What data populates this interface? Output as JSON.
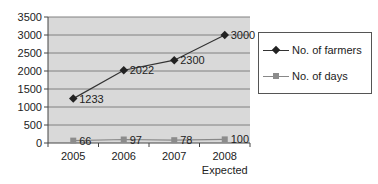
{
  "chart_data": {
    "type": "line",
    "title": "",
    "xlabel": "",
    "ylabel": "",
    "categories": [
      "2005",
      "2006",
      "2007",
      "2008"
    ],
    "category_sublabels": [
      "",
      "",
      "",
      "Expected"
    ],
    "ylim": [
      0,
      3500
    ],
    "yticks": [
      0,
      500,
      1000,
      1500,
      2000,
      2500,
      3000,
      3500
    ],
    "grid": true,
    "legend_position": "right",
    "series": [
      {
        "name": "No. of farmers",
        "values": [
          1233,
          2022,
          2300,
          3000
        ],
        "color": "#333333",
        "marker": "diamond"
      },
      {
        "name": "No. of days",
        "values": [
          66,
          97,
          78,
          100
        ],
        "color": "#888888",
        "marker": "square"
      }
    ]
  },
  "legend": {
    "items": [
      {
        "label": "No. of farmers"
      },
      {
        "label": "No. of days"
      }
    ]
  },
  "colors": {
    "plot_background": "#d9d9d9",
    "gridline": "#808080",
    "farmers_line": "#333333",
    "days_line": "#888888"
  }
}
